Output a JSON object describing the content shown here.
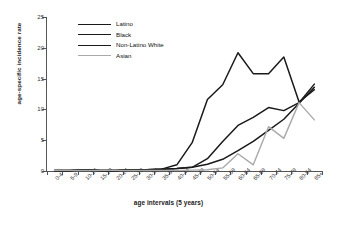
{
  "chart_data": {
    "type": "line",
    "title": "",
    "xlabel": "age intervals (5 years)",
    "ylabel": "age-specific incidence rate",
    "categories": [
      "0-4",
      "5-9",
      "10-14",
      "15-19",
      "20-24",
      "25-29",
      "30-34",
      "35-39",
      "40-44",
      "45-49",
      "50-54",
      "55-59",
      "60-64",
      "65-69",
      "70-74",
      "75-79",
      "80-84",
      "85+"
    ],
    "ylim": [
      0,
      25
    ],
    "yticks": [
      0,
      5,
      10,
      15,
      20,
      25
    ],
    "grid": false,
    "legend_position": "top-left-inside",
    "series": [
      {
        "name": "Latino",
        "color": "#1a1a1a",
        "width": 1.5,
        "values": [
          0.1,
          0.1,
          0.2,
          0.1,
          0.1,
          0.2,
          0.2,
          0.3,
          1.0,
          4.6,
          11.6,
          14.0,
          19.2,
          15.8,
          15.8,
          18.5,
          11.2,
          13.2
        ]
      },
      {
        "name": "Black",
        "color": "#1a1a1a",
        "width": 1.5,
        "values": [
          0.1,
          0.1,
          0.2,
          0.1,
          0.1,
          0.2,
          0.2,
          0.3,
          0.4,
          0.6,
          2.0,
          4.8,
          7.4,
          8.7,
          10.3,
          9.8,
          11.1,
          14.1
        ]
      },
      {
        "name": "Non-Latino White",
        "color": "#1a1a1a",
        "width": 1.5,
        "values": [
          0.1,
          0.1,
          0.2,
          0.1,
          0.1,
          0.2,
          0.2,
          0.3,
          0.4,
          0.6,
          1.1,
          1.9,
          3.3,
          4.8,
          6.6,
          8.4,
          11.0,
          13.6
        ]
      },
      {
        "name": "Asian",
        "color": "#a9a9a9",
        "width": 1.4,
        "values": [
          0.1,
          0.1,
          0.1,
          0.1,
          0.1,
          0.1,
          0.1,
          0.1,
          0.1,
          0.15,
          0.2,
          0.5,
          2.8,
          1.0,
          7.2,
          5.3,
          11.1,
          8.3
        ]
      }
    ]
  },
  "legend": {
    "items": [
      {
        "label": "Latino"
      },
      {
        "label": "Black"
      },
      {
        "label": "Non-Latino White"
      },
      {
        "label": "Asian"
      }
    ]
  }
}
